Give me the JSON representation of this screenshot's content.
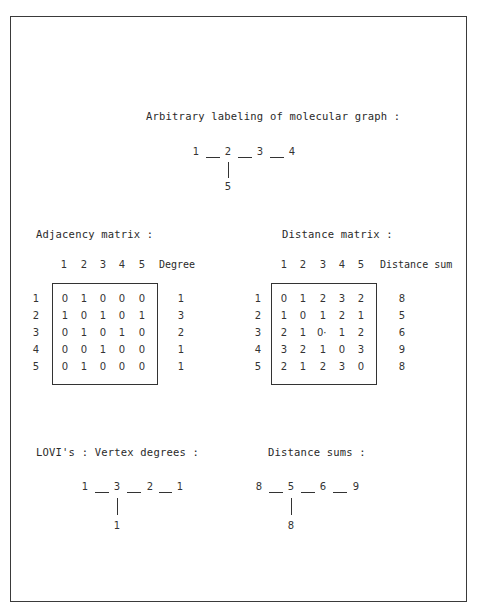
{
  "labeling": {
    "title": "Arbitrary labeling of molecular graph :",
    "graph": {
      "chain": [
        "1",
        "2",
        "3",
        "4"
      ],
      "branch": "5",
      "branch_from_index": 1
    }
  },
  "adjacency": {
    "title": "Adjacency matrix :",
    "col_headers": [
      "1",
      "2",
      "3",
      "4",
      "5"
    ],
    "extra_header": "Degree",
    "row_labels": [
      "1",
      "2",
      "3",
      "4",
      "5"
    ],
    "rows": [
      [
        "0",
        "1",
        "0",
        "0",
        "0"
      ],
      [
        "1",
        "0",
        "1",
        "0",
        "1"
      ],
      [
        "0",
        "1",
        "0",
        "1",
        "0"
      ],
      [
        "0",
        "0",
        "1",
        "0",
        "0"
      ],
      [
        "0",
        "1",
        "0",
        "0",
        "0"
      ]
    ],
    "extra_values": [
      "1",
      "3",
      "2",
      "1",
      "1"
    ]
  },
  "distance": {
    "title": "Distance matrix :",
    "col_headers": [
      "1",
      "2",
      "3",
      "4",
      "5"
    ],
    "extra_header": "Distance sum",
    "row_labels": [
      "1",
      "2",
      "3",
      "4",
      "5"
    ],
    "rows": [
      [
        "0",
        "1",
        "2",
        "3",
        "2"
      ],
      [
        "1",
        "0",
        "1",
        "2",
        "1"
      ],
      [
        "2",
        "1",
        "0·",
        "1",
        "2"
      ],
      [
        "3",
        "2",
        "1",
        "0",
        "3"
      ],
      [
        "2",
        "1",
        "2",
        "3",
        "0"
      ]
    ],
    "extra_values": [
      "8",
      "5",
      "6",
      "9",
      "8"
    ]
  },
  "lovi_degrees": {
    "title": "LOVI's : Vertex degrees :",
    "graph": {
      "chain": [
        "1",
        "3",
        "2",
        "1"
      ],
      "branch": "1",
      "branch_from_index": 1
    }
  },
  "lovi_distance": {
    "title": "Distance sums :",
    "graph": {
      "chain": [
        "8",
        "5",
        "6",
        "9"
      ],
      "branch": "8",
      "branch_from_index": 1
    }
  }
}
